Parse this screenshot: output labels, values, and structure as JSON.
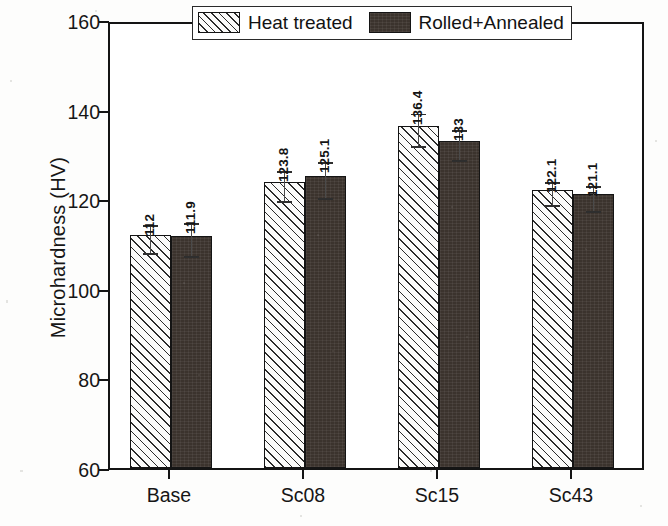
{
  "chart_data": {
    "type": "bar",
    "title": "",
    "xlabel": "",
    "ylabel": "Microhardness (HV)",
    "categories": [
      "Base",
      "Sc08",
      "Sc15",
      "Sc43"
    ],
    "ylim": [
      60,
      160
    ],
    "yticks": [
      60,
      80,
      100,
      120,
      140,
      160
    ],
    "ytick_labels": [
      "60",
      "80",
      "100",
      "120",
      "140",
      "160"
    ],
    "grid": false,
    "legend_position": "top-right-inside",
    "series": [
      {
        "name": "Heat treated",
        "fill": "diagonal-hatch",
        "color": "#fbfbfa",
        "values": [
          112,
          123.8,
          136.4,
          122.1
        ],
        "value_labels": [
          "112",
          "123.8",
          "136.4",
          "122.1"
        ],
        "errors": [
          3.2,
          3.4,
          3.6,
          2.6
        ]
      },
      {
        "name": "Rolled+Annealed",
        "fill": "solid-dark",
        "color": "#3b332d",
        "values": [
          111.9,
          125.1,
          133,
          121.1
        ],
        "value_labels": [
          "111.9",
          "125.1",
          "133",
          "121.1"
        ],
        "errors": [
          3.6,
          4.0,
          3.4,
          2.8
        ]
      }
    ]
  },
  "legend": {
    "items": [
      {
        "label": "Heat treated",
        "swatch": "hatch-swatch"
      },
      {
        "label": "Rolled+Annealed",
        "swatch": "solid-swatch"
      }
    ]
  },
  "axes": {
    "y_title": "Microhardness (HV)"
  }
}
